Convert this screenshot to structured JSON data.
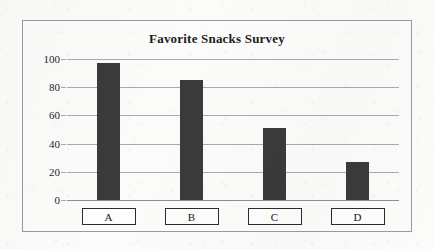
{
  "chart_data": {
    "type": "bar",
    "title": "Favorite Snacks Survey",
    "xlabel": "",
    "ylabel": "",
    "categories": [
      "A",
      "B",
      "C",
      "D"
    ],
    "values": [
      97,
      85,
      51,
      27
    ],
    "ylim": [
      0,
      100
    ],
    "yticks": [
      0,
      20,
      40,
      60,
      80,
      100
    ],
    "ytick_labels": [
      "0",
      "20",
      "40",
      "60",
      "80",
      "100"
    ],
    "grid": true,
    "legend": false,
    "bar_color": "#3a3a3a",
    "gridline_color": "#a9a9a9",
    "frame_color": "#9a9a9a",
    "background_color": "#fbfbfa"
  },
  "axis": {
    "ticks": [
      {
        "label": "100",
        "value": 100
      },
      {
        "label": "80",
        "value": 80
      },
      {
        "label": "60",
        "value": 60
      },
      {
        "label": "40",
        "value": 40
      },
      {
        "label": "20",
        "value": 20
      },
      {
        "label": "0",
        "value": 0
      }
    ]
  },
  "bars": [
    {
      "category": "A",
      "value": 97
    },
    {
      "category": "B",
      "value": 85
    },
    {
      "category": "C",
      "value": 51
    },
    {
      "category": "D",
      "value": 27
    }
  ]
}
